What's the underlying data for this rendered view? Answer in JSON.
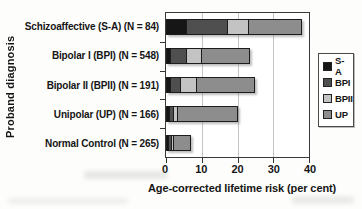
{
  "chart_data": {
    "type": "bar",
    "orientation": "horizontal",
    "stacked": true,
    "xlabel": "Age-corrected lifetime risk (per cent)",
    "ylabel": "Proband diagnosis",
    "xlim": [
      0,
      40
    ],
    "xticks": [
      0,
      10,
      20,
      30,
      40
    ],
    "grid": "vertical-gridlines",
    "legend_position": "right",
    "categories": [
      "Schizoaffective (S-A) (N = 84)",
      "Bipolar I (BPI) (N = 548)",
      "Bipolar II (BPII) (N = 191)",
      "Unipolar (UP) (N = 166)",
      "Normal Control (N = 265)"
    ],
    "series": [
      {
        "name": "S-A",
        "color": "#161616",
        "values": [
          5.5,
          1.0,
          1.0,
          0.5,
          0.5
        ]
      },
      {
        "name": "BPI",
        "color": "#4f4f4f",
        "values": [
          11.5,
          4.5,
          2.5,
          1.0,
          0.5
        ]
      },
      {
        "name": "BPII",
        "color": "#c3c3c3",
        "values": [
          6.0,
          4.0,
          4.5,
          1.0,
          0.5
        ]
      },
      {
        "name": "UP",
        "color": "#8d8d8d",
        "values": [
          15.0,
          14.0,
          17.0,
          17.5,
          5.5
        ]
      }
    ],
    "colors": {
      "bar_border": "#1c1c1c",
      "plot_border": "#3a3a3a",
      "gridline": "#c4c4c2",
      "background": "#ffffff"
    }
  }
}
